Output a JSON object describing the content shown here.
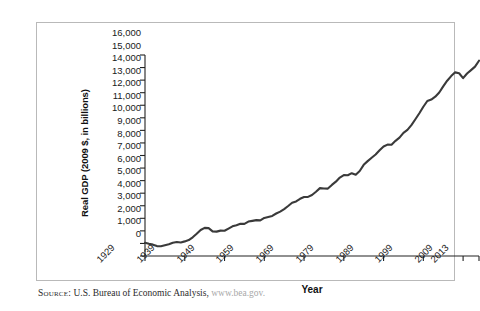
{
  "figure": {
    "source_label": "Source:",
    "source_text": " U.S. Bureau of Economic Analysis, ",
    "source_url": "www.bea.gov."
  },
  "chart_data": {
    "type": "line",
    "title": "",
    "xlabel": "Year",
    "ylabel": "Real GDP (2009 $, in billions)",
    "xlim": [
      1929,
      2013
    ],
    "ylim": [
      0,
      16000
    ],
    "grid": false,
    "legend": "none",
    "line_color": "#3a3a3a",
    "xtick_labels": [
      "1929",
      "1939",
      "1949",
      "1959",
      "1969",
      "1979",
      "1989",
      "1999",
      "2009",
      "2013"
    ],
    "xtick_values": [
      1929,
      1939,
      1949,
      1959,
      1969,
      1979,
      1989,
      1999,
      2009,
      2013
    ],
    "ytick_labels": [
      "0",
      "1,000",
      "2,000",
      "3,000",
      "4,000",
      "5,000",
      "6,000",
      "7,000",
      "8,000",
      "9,000",
      "10,000",
      "11,000",
      "12,000",
      "13,000",
      "14,000",
      "15,000",
      "16,000"
    ],
    "ytick_values": [
      0,
      1000,
      2000,
      3000,
      4000,
      5000,
      6000,
      7000,
      8000,
      9000,
      10000,
      11000,
      12000,
      13000,
      14000,
      15000,
      16000
    ],
    "x": [
      1929,
      1930,
      1931,
      1932,
      1933,
      1934,
      1935,
      1936,
      1937,
      1938,
      1939,
      1940,
      1941,
      1942,
      1943,
      1944,
      1945,
      1946,
      1947,
      1948,
      1949,
      1950,
      1951,
      1952,
      1953,
      1954,
      1955,
      1956,
      1957,
      1958,
      1959,
      1960,
      1961,
      1962,
      1963,
      1964,
      1965,
      1966,
      1967,
      1968,
      1969,
      1970,
      1971,
      1972,
      1973,
      1974,
      1975,
      1976,
      1977,
      1978,
      1979,
      1980,
      1981,
      1982,
      1983,
      1984,
      1985,
      1986,
      1987,
      1988,
      1989,
      1990,
      1991,
      1992,
      1993,
      1994,
      1995,
      1996,
      1997,
      1998,
      1999,
      2000,
      2001,
      2002,
      2003,
      2004,
      2005,
      2006,
      2007,
      2008,
      2009,
      2010,
      2011,
      2012,
      2013
    ],
    "y": [
      1057,
      966,
      904,
      788,
      778,
      862,
      939,
      1061,
      1115,
      1078,
      1164,
      1266,
      1490,
      1772,
      2074,
      2240,
      2218,
      1961,
      1940,
      2021,
      2009,
      2184,
      2360,
      2456,
      2571,
      2556,
      2739,
      2797,
      2856,
      2835,
      3031,
      3109,
      3189,
      3383,
      3530,
      3734,
      3977,
      4236,
      4346,
      4553,
      4694,
      4702,
      4857,
      5114,
      5404,
      5378,
      5367,
      5657,
      5917,
      6247,
      6445,
      6428,
      6593,
      6476,
      6769,
      7256,
      7553,
      7822,
      8078,
      8412,
      8712,
      8868,
      8854,
      9169,
      9422,
      9806,
      10038,
      10416,
      10884,
      11362,
      11881,
      12338,
      12454,
      12678,
      13013,
      13506,
      13954,
      14320,
      14618,
      14549,
      14159,
      14526,
      14797,
      15077,
      15545
    ],
    "series_name": "Real GDP"
  }
}
